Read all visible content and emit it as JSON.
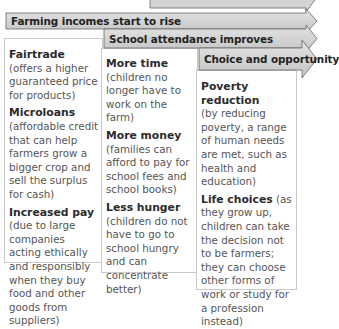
{
  "diagram": {
    "stages": [
      {
        "title": "Farming incomes start to rise",
        "items": [
          {
            "term": "Fairtrade",
            "desc": "(offers a higher guaranteed price for products)"
          },
          {
            "term": "Microloans",
            "desc": "(affordable credit that can help farmers grow a bigger crop and sell the surplus for cash)"
          },
          {
            "term": "Increased pay",
            "desc": "(due to large companies acting ethically and responsibly when they buy food and other goods from suppliers)"
          }
        ]
      },
      {
        "title": "School attendance improves",
        "items": [
          {
            "term": "More time",
            "desc": "(children no longer have to work on the farm)"
          },
          {
            "term": "More money",
            "desc": "(families can afford to pay for school fees and school books)"
          },
          {
            "term": "Less hunger",
            "desc": "(children do not have to go to school hungry and can concentrate better)"
          }
        ]
      },
      {
        "title": "Choice and opportunity",
        "items": [
          {
            "term": "Poverty reduction",
            "desc": "(by reducing poverty, a range of human needs are met, such as health and education)"
          },
          {
            "term": "Life choices",
            "desc": "(as they grow up, children can take the decision not to be farmers; they can choose other forms of work or study for a profession instead)"
          }
        ]
      }
    ],
    "colors": {
      "banner_fill_top": "#e4e4e4",
      "banner_fill_bottom": "#c4c4c4",
      "banner_stroke": "#666666",
      "box_border": "#c9c9c9"
    }
  }
}
